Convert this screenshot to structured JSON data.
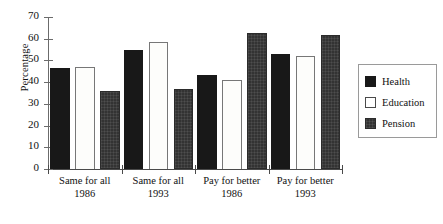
{
  "chart_data": {
    "type": "bar",
    "title": "",
    "subtitle": "",
    "xlabel": "",
    "ylabel": "Percentage",
    "ylim": [
      0,
      70
    ],
    "ytick_labels": [
      "0",
      "10",
      "20",
      "30",
      "40",
      "50",
      "60",
      "70"
    ],
    "ytick_values": [
      0,
      10,
      20,
      30,
      40,
      50,
      60,
      70
    ],
    "grid": false,
    "legend_position": "right",
    "categories": [
      "Same for all 1986",
      "Same for all 1993",
      "Pay for better 1986",
      "Pay for better 1993"
    ],
    "category_lines": [
      {
        "line1": "Same for all",
        "line2": "1986"
      },
      {
        "line1": "Same for all",
        "line2": "1993"
      },
      {
        "line1": "Pay for better",
        "line2": "1986"
      },
      {
        "line1": "Pay for better",
        "line2": "1993"
      }
    ],
    "series": [
      {
        "name": "Health",
        "color": "#181818",
        "values": [
          46.5,
          55.0,
          43.5,
          53.0
        ]
      },
      {
        "name": "Education",
        "color": "#ffffff",
        "values": [
          47.0,
          58.5,
          41.0,
          52.0
        ]
      },
      {
        "name": "Pension",
        "color": "#333333",
        "values": [
          36.0,
          37.0,
          62.5,
          61.5
        ]
      }
    ]
  },
  "legend": {
    "items": [
      {
        "label": "Health"
      },
      {
        "label": "Education"
      },
      {
        "label": "Pension"
      }
    ]
  }
}
